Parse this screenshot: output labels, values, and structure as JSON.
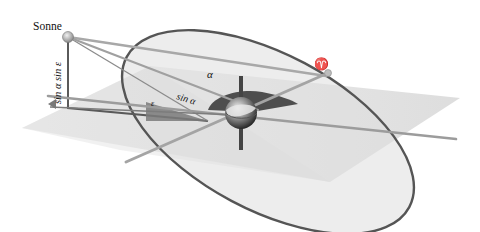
{
  "diagram": {
    "labels": {
      "sun": "Sonne",
      "vertical_component": "sin α sin ε",
      "obliquity_angle": "ε",
      "projected_component": "sin α",
      "right_ascension_angle": "α",
      "vernal_equinox": "♈"
    },
    "colors": {
      "ecliptic_ring": "#555555",
      "ecliptic_fill": "#dcdcdc",
      "equator_plane": "#c8c8c8",
      "triangle": "#7a7a7a",
      "angle_sector": "#555555",
      "rod": "#a0a0a0",
      "box_outline": "#5a5a5a"
    }
  }
}
